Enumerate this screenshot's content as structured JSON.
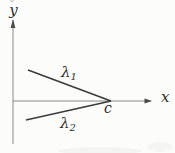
{
  "figure": {
    "colors": {
      "background": "#fcfcfb",
      "axis": "#8a8a8a",
      "arrow": "#4a4a4a",
      "ray": "#3c3c3c",
      "text": "#2e2e2e",
      "artifact": "#b5b5b5",
      "smudge": "#ededea"
    },
    "labels": {
      "y_axis": "y",
      "x_axis": "x",
      "point": "c",
      "lambda": "λ",
      "sub1": "1",
      "sub2": "2"
    },
    "geometry": {
      "y_axis": {
        "x": 13,
        "top": 20,
        "bottom": 144
      },
      "x_axis": {
        "y": 101,
        "left": 13,
        "right": 151
      },
      "ray1": {
        "x1": 28,
        "y1": 70,
        "x2": 111,
        "y2": 101
      },
      "ray2": {
        "x1": 26,
        "y1": 120,
        "x2": 111,
        "y2": 101
      },
      "point_c": {
        "x": 111,
        "y": 101
      }
    }
  }
}
